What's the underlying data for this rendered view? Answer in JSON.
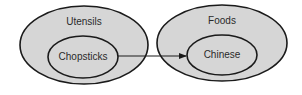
{
  "diagram": {
    "colors": {
      "fill": "#d6d6d6",
      "stroke": "#1a1a1a",
      "background": "#ffffff"
    },
    "groups": [
      {
        "label": "Utensils",
        "inner": {
          "label": "Chopsticks"
        }
      },
      {
        "label": "Foods",
        "inner": {
          "label": "Chinese"
        }
      }
    ],
    "arrow": {
      "from": "Chopsticks",
      "to": "Chinese"
    }
  }
}
